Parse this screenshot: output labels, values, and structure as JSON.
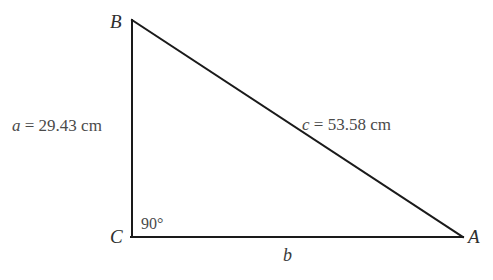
{
  "figure": {
    "kind": "right-triangle",
    "background_color": "#ffffff",
    "stroke_color": "#1a1a1a",
    "stroke_width": 2,
    "text_color": "#4a4a4a",
    "vertices": {
      "A": {
        "label": "A",
        "x": 462,
        "y": 237
      },
      "B": {
        "label": "B",
        "x": 132,
        "y": 20
      },
      "C": {
        "label": "C",
        "x": 132,
        "y": 237
      }
    },
    "angles": [
      {
        "at": "C",
        "label": "90°",
        "degrees": 90
      }
    ],
    "sides": [
      {
        "name": "a",
        "from": "B",
        "to": "C",
        "orientation": "vertical",
        "label": "a = 29.43 cm",
        "variable": "a",
        "value_text": "= 29.43 cm",
        "value": 29.43,
        "unit": "cm"
      },
      {
        "name": "b",
        "from": "C",
        "to": "A",
        "orientation": "horizontal",
        "label": "b",
        "variable": "b",
        "value_text": "",
        "value": null,
        "unit": ""
      },
      {
        "name": "c",
        "from": "B",
        "to": "A",
        "orientation": "hypotenuse",
        "label": "c = 53.58 cm",
        "variable": "c",
        "value_text": "= 53.58 cm",
        "value": 53.58,
        "unit": "cm"
      }
    ]
  }
}
